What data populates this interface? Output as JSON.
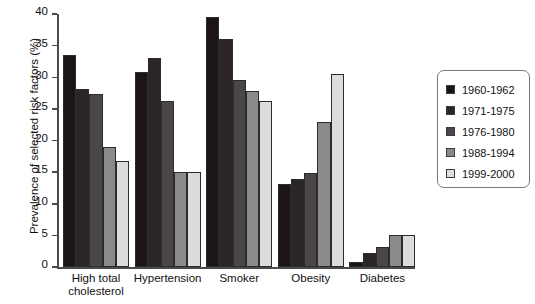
{
  "chart_data": {
    "type": "bar",
    "title": "",
    "xlabel": "",
    "ylabel": "Prevalence of selected risk factors (%)",
    "ylim": [
      0,
      40
    ],
    "ytick_labels": [
      "0",
      "5",
      "10",
      "15",
      "20",
      "25",
      "30",
      "35",
      "40"
    ],
    "yticks": [
      0,
      5,
      10,
      15,
      20,
      25,
      30,
      35,
      40
    ],
    "grid": false,
    "legend_position": "right",
    "categories": [
      "High total\ncholesterol",
      "Hypertension",
      "Smoker",
      "Obesity",
      "Diabetes"
    ],
    "series": [
      {
        "name": "1960-1962",
        "color": "#1b1519",
        "values": [
          33.5,
          30.8,
          39.5,
          13.2,
          0.8
        ]
      },
      {
        "name": "1971-1975",
        "color": "#2b2429",
        "values": [
          28.1,
          33.0,
          36.0,
          13.9,
          2.2
        ]
      },
      {
        "name": "1976-1980",
        "color": "#4a4649",
        "values": [
          27.4,
          26.2,
          29.5,
          14.8,
          3.2
        ]
      },
      {
        "name": "1988-1994",
        "color": "#8a8a8a",
        "values": [
          19.0,
          15.1,
          27.8,
          22.9,
          5.1
        ]
      },
      {
        "name": "1999-2000",
        "color": "#dcdcdc",
        "values": [
          16.8,
          15.0,
          26.3,
          30.5,
          5.1
        ]
      }
    ]
  },
  "legend": {
    "entries": [
      "1960-1962",
      "1971-1975",
      "1976-1980",
      "1988-1994",
      "1999-2000"
    ]
  }
}
